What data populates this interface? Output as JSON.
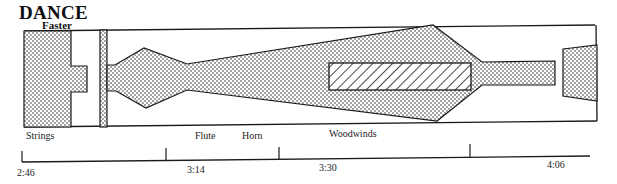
{
  "header": {
    "title": "DANCE",
    "subtitle": "Faster"
  },
  "instrument_labels": [
    {
      "label": "Strings"
    },
    {
      "label": "Flute"
    },
    {
      "label": "Horn"
    },
    {
      "label": "Woodwinds"
    }
  ],
  "timeline": {
    "ticks": [
      {
        "label": "2:46"
      },
      {
        "label": "3:14"
      },
      {
        "label": "3:30"
      },
      {
        "label": "4:06"
      }
    ]
  },
  "colors": {
    "ink": "#1a1a1a",
    "background": "#ffffff"
  }
}
